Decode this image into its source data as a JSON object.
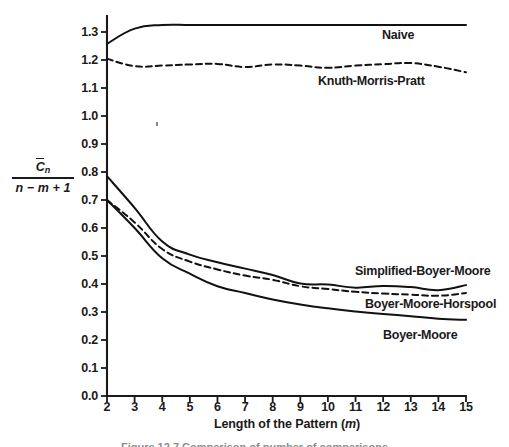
{
  "figure": {
    "caption": "Figure 12.7   Comparison of number of comparisons"
  },
  "axes": {
    "x": {
      "title_text": "Length of the Pattern (",
      "title_italic": "m",
      "title_close": ")",
      "ticks": [
        "2",
        "3",
        "4",
        "5",
        "6",
        "7",
        "8",
        "9",
        "10",
        "11",
        "12",
        "13",
        "14",
        "15"
      ]
    },
    "y": {
      "numerator": "C",
      "numerator_sub": "n",
      "denominator": "n − m + 1",
      "ticks": [
        "1.3",
        "1.2",
        "1.1",
        "1.0",
        "0.9",
        "0.8",
        "0.7",
        "0.6",
        "0.5",
        "0.4",
        "0.3",
        "0.2",
        "0.1",
        "0.0"
      ]
    }
  },
  "annotations": [
    {
      "name": "naive",
      "label": "Naive"
    },
    {
      "name": "knuth-morris-pratt",
      "label": "Knuth-Morris-Pratt"
    },
    {
      "name": "simplified-boyer-moore",
      "label": "Simplified-Boyer-Moore"
    },
    {
      "name": "boyer-moore-horspool",
      "label": "Boyer-Moore-Horspool"
    },
    {
      "name": "boyer-moore",
      "label": "Boyer-Moore"
    }
  ],
  "chart_data": {
    "type": "line",
    "title": "",
    "xlabel": "Length of the Pattern (m)",
    "ylabel": "C̄n / (n − m + 1)",
    "xlim": [
      2,
      15
    ],
    "ylim": [
      0.0,
      1.35
    ],
    "grid": false,
    "legend_position": "inline-right",
    "x": [
      2,
      3,
      4,
      5,
      6,
      7,
      8,
      9,
      10,
      11,
      12,
      13,
      14,
      15
    ],
    "series": [
      {
        "name": "Naive",
        "style": "solid",
        "color": "#111111",
        "values": [
          1.258,
          1.312,
          1.325,
          1.325,
          1.325,
          1.325,
          1.325,
          1.325,
          1.325,
          1.325,
          1.325,
          1.325,
          1.325,
          1.325
        ]
      },
      {
        "name": "Knuth-Morris-Pratt",
        "style": "dashed",
        "color": "#111111",
        "values": [
          1.205,
          1.178,
          1.18,
          1.184,
          1.186,
          1.175,
          1.184,
          1.18,
          1.172,
          1.18,
          1.185,
          1.189,
          1.176,
          1.156
        ]
      },
      {
        "name": "Simplified-Boyer-Moore",
        "style": "solid",
        "color": "#111111",
        "values": [
          0.785,
          0.672,
          0.552,
          0.505,
          0.478,
          0.455,
          0.432,
          0.402,
          0.398,
          0.387,
          0.393,
          0.389,
          0.378,
          0.396
        ]
      },
      {
        "name": "Boyer-Moore-Horspool",
        "style": "dashed",
        "color": "#111111",
        "values": [
          0.7,
          0.62,
          0.525,
          0.48,
          0.452,
          0.43,
          0.415,
          0.392,
          0.382,
          0.372,
          0.366,
          0.362,
          0.358,
          0.368
        ]
      },
      {
        "name": "Boyer-Moore",
        "style": "solid",
        "color": "#111111",
        "values": [
          0.7,
          0.6,
          0.492,
          0.437,
          0.392,
          0.368,
          0.345,
          0.327,
          0.313,
          0.302,
          0.293,
          0.285,
          0.276,
          0.272
        ]
      }
    ]
  }
}
